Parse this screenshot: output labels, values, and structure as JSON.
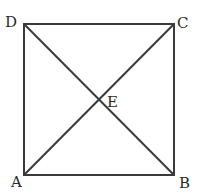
{
  "figure": {
    "type": "square with diagonals",
    "stroke_color": "#3a3a3a",
    "points": {
      "A": {
        "label": "A",
        "x": 24,
        "y": 175
      },
      "B": {
        "label": "B",
        "x": 174,
        "y": 175
      },
      "C": {
        "label": "C",
        "x": 174,
        "y": 24
      },
      "D": {
        "label": "D",
        "x": 24,
        "y": 24
      },
      "E": {
        "label": "E",
        "x": 99,
        "y": 100
      }
    },
    "segments": [
      "AB",
      "BC",
      "CD",
      "DA",
      "AC",
      "BD"
    ]
  }
}
